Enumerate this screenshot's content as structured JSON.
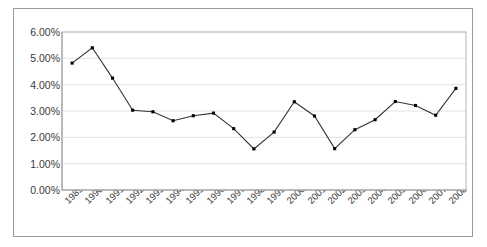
{
  "chart_data": {
    "type": "line",
    "title": "",
    "subtitle": "",
    "xlabel": "",
    "ylabel": "",
    "categories": [
      "1989",
      "1990",
      "1991",
      "1992",
      "1993",
      "1994",
      "1995",
      "1996",
      "1997",
      "1998",
      "1999",
      "2000",
      "2001",
      "2002",
      "2003",
      "2004",
      "2005",
      "2006",
      "2007",
      "2008"
    ],
    "values": [
      4.82,
      5.4,
      4.25,
      3.03,
      2.97,
      2.63,
      2.82,
      2.92,
      2.33,
      1.56,
      2.2,
      3.35,
      2.81,
      1.57,
      2.29,
      2.67,
      3.36,
      3.21,
      2.84,
      3.86
    ],
    "value_unit": "%",
    "ylim": [
      0,
      6
    ],
    "ytick_values": [
      6,
      5,
      4,
      3,
      2,
      1,
      0
    ],
    "ytick_labels": [
      "6.00%",
      "5.00%",
      "4.00%",
      "3.00%",
      "2.00%",
      "1.00%",
      "0.00%"
    ],
    "grid": "horizontal",
    "legend": "none",
    "series_name": "",
    "marker": "square",
    "line_color": "#333333",
    "marker_color": "#000000",
    "grid_color": "#e2e2e2",
    "axis_color": "#b5b5b5",
    "frame_color": "#9a9a9a",
    "plot_background": "#ffffff",
    "text_color": "#3a3a3a",
    "xtick_rotation": -45
  }
}
